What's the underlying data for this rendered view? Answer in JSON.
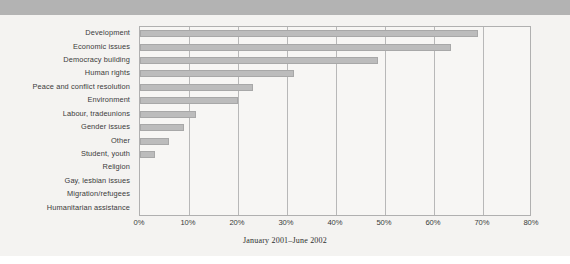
{
  "figure": {
    "caption": "January 2001–June 2002",
    "panel_background": "#f4f3f1",
    "top_band_color": "#b3b3b3",
    "bar_color": "#bcbcbc",
    "bar_border_color": "#a8a8a8",
    "grid_color": "#b8b8b8",
    "text_color": "#3a3a3a"
  },
  "chart_data": {
    "type": "bar",
    "orientation": "horizontal",
    "title": "",
    "subtitle": "",
    "xlabel": "January 2001–June 2002",
    "ylabel": "",
    "xlim": [
      0,
      80
    ],
    "ylim": null,
    "grid": true,
    "grid_axis": "x",
    "legend": false,
    "legend_position": "none",
    "value_unit": "%",
    "categories": [
      "Development",
      "Economic issues",
      "Democracy building",
      "Human rights",
      "Peace and conflict resolution",
      "Environment",
      "Labour, tradeunions",
      "Gender issues",
      "Other",
      "Student, youth",
      "Religion",
      "Gay, lesbian issues",
      "Migration/refugees",
      "Humanitarian assistance"
    ],
    "values": [
      69,
      63.5,
      48.5,
      31.5,
      23,
      20,
      11.5,
      9,
      6,
      3,
      0,
      0,
      0,
      0
    ],
    "xticks": [
      0,
      10,
      20,
      30,
      40,
      50,
      60,
      70,
      80
    ],
    "xticklabels": [
      "0%",
      "10%",
      "20%",
      "30%",
      "40%",
      "50%",
      "60%",
      "70%",
      "80%"
    ]
  }
}
